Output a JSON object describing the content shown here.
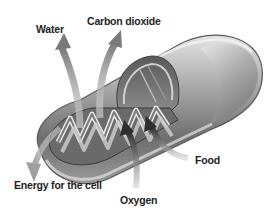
{
  "diagram": {
    "labels": {
      "water": "Water",
      "carbon_dioxide": "Carbon dioxide",
      "energy": "Energy for the cell",
      "oxygen": "Oxygen",
      "food": "Food"
    },
    "flows": {
      "outputs": [
        "Water",
        "Carbon dioxide",
        "Energy for the cell"
      ],
      "inputs": [
        "Oxygen",
        "Food"
      ]
    },
    "colors": {
      "background": "#ffffff",
      "organelle_dark": "#4a4a4a",
      "organelle_mid": "#8c8c8c",
      "organelle_light": "#d6d6d6",
      "output_arrow": "#9a9a9a",
      "input_arrow": "#3a3a3a",
      "text": "#1e1e1e"
    }
  }
}
